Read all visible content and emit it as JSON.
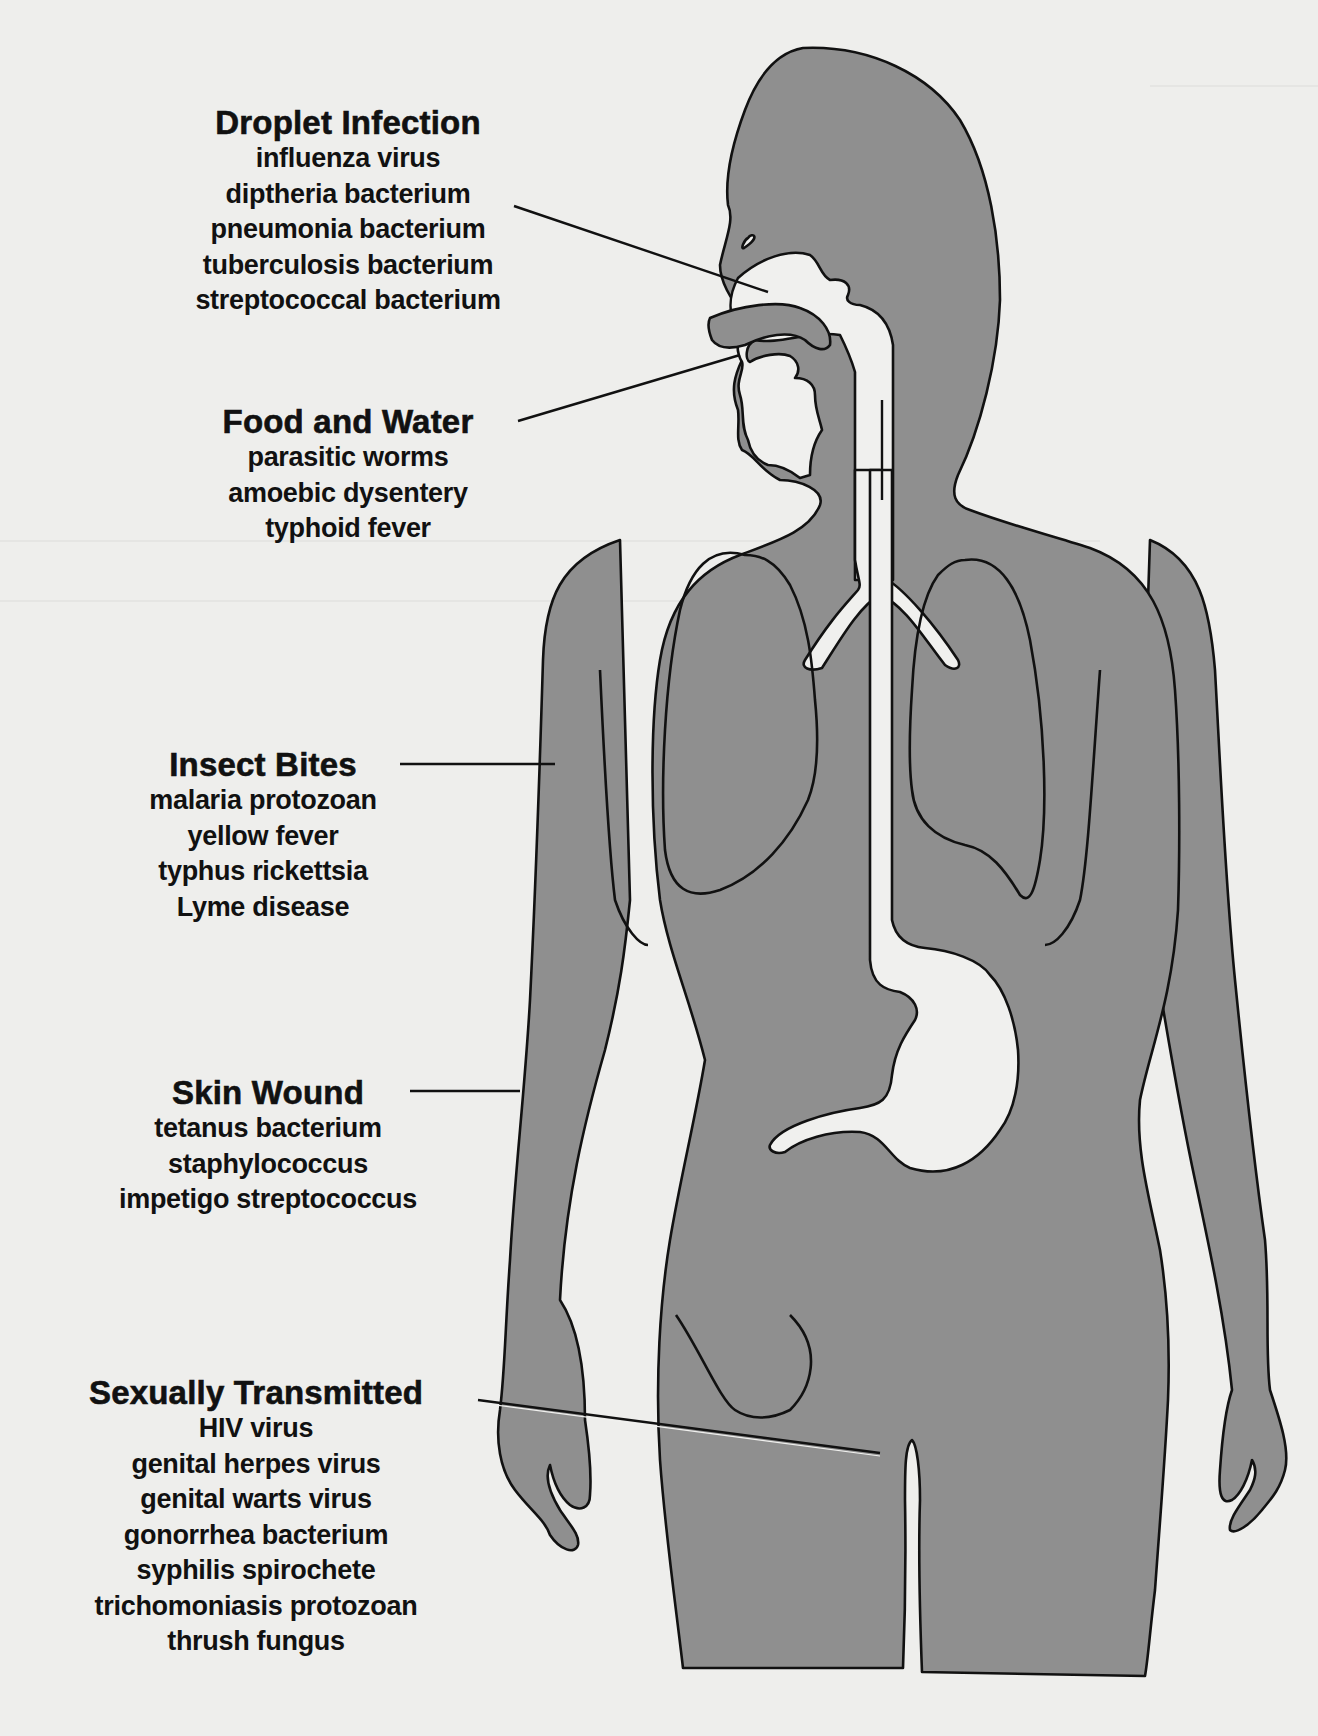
{
  "diagram": {
    "type": "labeled anatomical illustration",
    "colors": {
      "background": "#eeeeec",
      "body_fill": "#8f8f8f",
      "organ_cutout": "#f0f0ee",
      "outline": "#111111",
      "text": "#111111"
    },
    "groups": [
      {
        "heading": "Droplet Infection",
        "items": [
          "influenza virus",
          "diptheria bacterium",
          "pneumonia bacterium",
          "tuberculosis bacterium",
          "streptococcal bacterium"
        ],
        "points_to": "nose / nasal cavity"
      },
      {
        "heading": "Food and Water",
        "items": [
          "parasitic worms",
          "amoebic dysentery",
          "typhoid fever"
        ],
        "points_to": "mouth"
      },
      {
        "heading": "Insect Bites",
        "items": [
          "malaria protozoan",
          "yellow fever",
          "typhus rickettsia",
          "Lyme disease"
        ],
        "points_to": "upper arm skin"
      },
      {
        "heading": "Skin Wound",
        "items": [
          "tetanus bacterium",
          "staphylococcus",
          "impetigo streptococcus"
        ],
        "points_to": "forearm skin"
      },
      {
        "heading": "Sexually Transmitted",
        "items": [
          "HIV virus",
          "genital herpes virus",
          "genital warts virus",
          "gonorrhea bacterium",
          "syphilis spirochete",
          "trichomoniasis protozoan",
          "thrush fungus"
        ],
        "points_to": "genital area"
      }
    ]
  }
}
